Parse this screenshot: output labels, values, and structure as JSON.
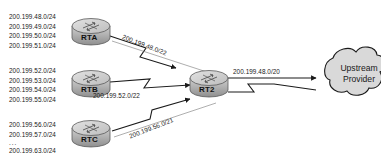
{
  "diagram": {
    "type": "network-topology",
    "background_color": "#ffffff",
    "line_color": "#1a1a1a",
    "router_fill": "#b5b5b5",
    "router_top_fill": "#d0d0d0",
    "cloud_fill": "#d9d9d9"
  },
  "routers": [
    {
      "id": "rta",
      "label": "RTA"
    },
    {
      "id": "rtb",
      "label": "RTB"
    },
    {
      "id": "rtc",
      "label": "RTC"
    },
    {
      "id": "rt2",
      "label": "RT2"
    }
  ],
  "prefix_blocks": {
    "rta": [
      "200.199.48.0/24",
      "200.199.49.0/24",
      "200.199.50.0/24",
      "200.199.51.0/24"
    ],
    "rtb": [
      "200.199.52.0/24",
      "200.199.53.0/24",
      "200.199.54.0/24",
      "200.199.55.0/24"
    ],
    "rtc": [
      "200.199.56.0/24",
      "200.199.57.0/24",
      "...",
      "200.199.63.0/24"
    ]
  },
  "link_labels": {
    "rta_to_rt2": "200.199.48.0/22",
    "rtb_to_rt2": "200.199.52.0/22",
    "rtc_to_rt2": "200.199.56.0/21",
    "rt2_to_upstream": "200.199.48.0/20"
  },
  "cloud": {
    "line1": "Upstream",
    "line2": "Provider"
  }
}
